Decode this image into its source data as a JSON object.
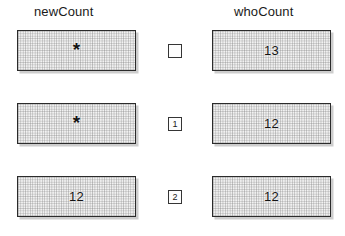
{
  "columns": [
    {
      "id": "newcount",
      "label": "newCount"
    },
    {
      "id": "whocount",
      "label": "whoCount"
    }
  ],
  "rows": [
    {
      "step": "",
      "step_empty": true,
      "newCount": "*",
      "whoCount": "13"
    },
    {
      "step": "1",
      "step_empty": false,
      "newCount": "*",
      "whoCount": "12"
    },
    {
      "step": "2",
      "step_empty": false,
      "newCount": "12",
      "whoCount": "12"
    }
  ],
  "colors": {
    "box_border": "#2b2b2b",
    "box_fill": "#f2f2f2",
    "text": "#141414",
    "shadow": "#5a5a5a",
    "background": "#ffffff"
  }
}
